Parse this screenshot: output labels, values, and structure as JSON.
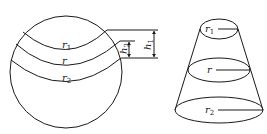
{
  "diagram": {
    "sphere": {
      "labels": {
        "r1": {
          "base": "r",
          "sub": "1"
        },
        "r": {
          "base": "r",
          "sub": ""
        },
        "r2": {
          "base": "r",
          "sub": "2"
        },
        "h1": {
          "base": "h",
          "sub": "1"
        },
        "h2": {
          "base": "h",
          "sub": "2"
        }
      }
    },
    "frustum": {
      "labels": {
        "r1": {
          "base": "r",
          "sub": "1"
        },
        "r": {
          "base": "r",
          "sub": ""
        },
        "r2": {
          "base": "r",
          "sub": "2"
        }
      }
    },
    "colors": {
      "line": "#1a1a1a",
      "background": "#ffffff"
    }
  }
}
